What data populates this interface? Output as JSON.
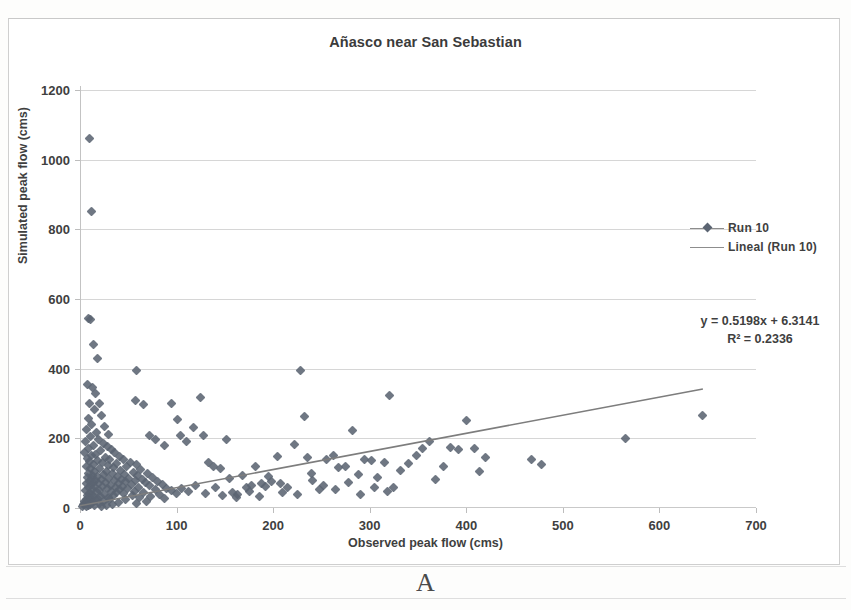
{
  "figure": {
    "panel_label": "A"
  },
  "chart_data": {
    "type": "scatter",
    "title": "Añasco near San Sebastian",
    "xlabel": "Observed peak flow (cms)",
    "ylabel": "Simulated peak flow (cms)",
    "xlim": [
      0,
      700
    ],
    "ylim": [
      0,
      1200
    ],
    "xticks": [
      0,
      100,
      200,
      300,
      400,
      500,
      600,
      700
    ],
    "yticks": [
      0,
      200,
      400,
      600,
      800,
      1000,
      1200
    ],
    "grid": "horizontal",
    "legend_position": "right",
    "marker_color": "#5b6472",
    "trendline_color": "#7d7d7d",
    "gridline_color": "#d6d6d6",
    "series": [
      {
        "name": "Run 10",
        "kind": "scatter",
        "marker": "diamond",
        "points": [
          [
            10,
            1060
          ],
          [
            12,
            850
          ],
          [
            9,
            545
          ],
          [
            11,
            540
          ],
          [
            14,
            470
          ],
          [
            18,
            430
          ],
          [
            8,
            355
          ],
          [
            13,
            345
          ],
          [
            16,
            330
          ],
          [
            10,
            300
          ],
          [
            20,
            300
          ],
          [
            15,
            282
          ],
          [
            22,
            265
          ],
          [
            9,
            258
          ],
          [
            12,
            240
          ],
          [
            25,
            235
          ],
          [
            7,
            225
          ],
          [
            17,
            218
          ],
          [
            30,
            212
          ],
          [
            11,
            205
          ],
          [
            19,
            198
          ],
          [
            6,
            192
          ],
          [
            24,
            185
          ],
          [
            14,
            180
          ],
          [
            28,
            176
          ],
          [
            9,
            172
          ],
          [
            33,
            168
          ],
          [
            21,
            164
          ],
          [
            5,
            160
          ],
          [
            36,
            158
          ],
          [
            16,
            154
          ],
          [
            12,
            150
          ],
          [
            41,
            148
          ],
          [
            26,
            145
          ],
          [
            8,
            142
          ],
          [
            45,
            140
          ],
          [
            31,
            138
          ],
          [
            18,
            136
          ],
          [
            10,
            134
          ],
          [
            52,
            132
          ],
          [
            23,
            130
          ],
          [
            38,
            128
          ],
          [
            14,
            126
          ],
          [
            58,
            124
          ],
          [
            29,
            122
          ],
          [
            7,
            120
          ],
          [
            48,
            118
          ],
          [
            35,
            116
          ],
          [
            20,
            114
          ],
          [
            11,
            112
          ],
          [
            63,
            110
          ],
          [
            42,
            108
          ],
          [
            27,
            106
          ],
          [
            15,
            104
          ],
          [
            55,
            102
          ],
          [
            34,
            100
          ],
          [
            9,
            99
          ],
          [
            70,
            98
          ],
          [
            46,
            96
          ],
          [
            24,
            95
          ],
          [
            13,
            94
          ],
          [
            60,
            92
          ],
          [
            39,
            90
          ],
          [
            18,
            89
          ],
          [
            8,
            88
          ],
          [
            75,
            87
          ],
          [
            50,
            86
          ],
          [
            30,
            85
          ],
          [
            12,
            84
          ],
          [
            65,
            83
          ],
          [
            43,
            82
          ],
          [
            22,
            81
          ],
          [
            16,
            80
          ],
          [
            57,
            79
          ],
          [
            36,
            78
          ],
          [
            10,
            77
          ],
          [
            80,
            76
          ],
          [
            47,
            75
          ],
          [
            26,
            74
          ],
          [
            14,
            73
          ],
          [
            68,
            72
          ],
          [
            40,
            71
          ],
          [
            19,
            70
          ],
          [
            7,
            69
          ],
          [
            85,
            68
          ],
          [
            53,
            67
          ],
          [
            32,
            66
          ],
          [
            11,
            65
          ],
          [
            72,
            64
          ],
          [
            44,
            63
          ],
          [
            23,
            62
          ],
          [
            15,
            61
          ],
          [
            61,
            60
          ],
          [
            37,
            59
          ],
          [
            9,
            58
          ],
          [
            90,
            57
          ],
          [
            49,
            56
          ],
          [
            28,
            55
          ],
          [
            13,
            54
          ],
          [
            78,
            53
          ],
          [
            41,
            52
          ],
          [
            20,
            51
          ],
          [
            6,
            50
          ],
          [
            95,
            49
          ],
          [
            56,
            48
          ],
          [
            33,
            47
          ],
          [
            17,
            46
          ],
          [
            66,
            45
          ],
          [
            38,
            44
          ],
          [
            10,
            43
          ],
          [
            100,
            42
          ],
          [
            45,
            41
          ],
          [
            25,
            40
          ],
          [
            12,
            39
          ],
          [
            82,
            38
          ],
          [
            35,
            37
          ],
          [
            8,
            36
          ],
          [
            54,
            35
          ],
          [
            21,
            34
          ],
          [
            14,
            33
          ],
          [
            73,
            32
          ],
          [
            29,
            31
          ],
          [
            9,
            30
          ],
          [
            62,
            29
          ],
          [
            18,
            28
          ],
          [
            11,
            27
          ],
          [
            88,
            26
          ],
          [
            31,
            25
          ],
          [
            7,
            24
          ],
          [
            47,
            23
          ],
          [
            16,
            22
          ],
          [
            10,
            21
          ],
          [
            69,
            20
          ],
          [
            24,
            19
          ],
          [
            5,
            18
          ],
          [
            40,
            17
          ],
          [
            13,
            16
          ],
          [
            8,
            15
          ],
          [
            58,
            14
          ],
          [
            20,
            13
          ],
          [
            6,
            12
          ],
          [
            34,
            11
          ],
          [
            11,
            10
          ],
          [
            4,
            9
          ],
          [
            27,
            8
          ],
          [
            9,
            7
          ],
          [
            15,
            6
          ],
          [
            3,
            5
          ],
          [
            22,
            4
          ],
          [
            7,
            3
          ],
          [
            58,
            395
          ],
          [
            57,
            310
          ],
          [
            66,
            298
          ],
          [
            72,
            208
          ],
          [
            78,
            196
          ],
          [
            88,
            178
          ],
          [
            95,
            300
          ],
          [
            101,
            255
          ],
          [
            104,
            208
          ],
          [
            110,
            190
          ],
          [
            118,
            230
          ],
          [
            125,
            318
          ],
          [
            128,
            208
          ],
          [
            133,
            130
          ],
          [
            138,
            120
          ],
          [
            145,
            112
          ],
          [
            152,
            198
          ],
          [
            158,
            45
          ],
          [
            163,
            38
          ],
          [
            168,
            92
          ],
          [
            172,
            60
          ],
          [
            178,
            65
          ],
          [
            182,
            118
          ],
          [
            188,
            70
          ],
          [
            192,
            62
          ],
          [
            198,
            75
          ],
          [
            204,
            148
          ],
          [
            208,
            70
          ],
          [
            215,
            58
          ],
          [
            222,
            182
          ],
          [
            228,
            395
          ],
          [
            232,
            262
          ],
          [
            236,
            145
          ],
          [
            241,
            80
          ],
          [
            248,
            52
          ],
          [
            255,
            138
          ],
          [
            262,
            150
          ],
          [
            268,
            115
          ],
          [
            275,
            120
          ],
          [
            282,
            222
          ],
          [
            288,
            96
          ],
          [
            295,
            140
          ],
          [
            302,
            135
          ],
          [
            308,
            88
          ],
          [
            315,
            132
          ],
          [
            320,
            322
          ],
          [
            325,
            60
          ],
          [
            332,
            108
          ],
          [
            340,
            128
          ],
          [
            348,
            150
          ],
          [
            355,
            172
          ],
          [
            362,
            190
          ],
          [
            368,
            82
          ],
          [
            376,
            118
          ],
          [
            384,
            175
          ],
          [
            392,
            168
          ],
          [
            400,
            250
          ],
          [
            408,
            172
          ],
          [
            414,
            105
          ],
          [
            420,
            145
          ],
          [
            468,
            140
          ],
          [
            478,
            126
          ],
          [
            565,
            200
          ],
          [
            645,
            265
          ],
          [
            105,
            55
          ],
          [
            112,
            48
          ],
          [
            120,
            66
          ],
          [
            130,
            42
          ],
          [
            140,
            58
          ],
          [
            148,
            36
          ],
          [
            155,
            84
          ],
          [
            162,
            30
          ],
          [
            175,
            46
          ],
          [
            186,
            34
          ],
          [
            195,
            90
          ],
          [
            210,
            44
          ],
          [
            225,
            38
          ],
          [
            240,
            100
          ],
          [
            252,
            66
          ],
          [
            265,
            54
          ],
          [
            278,
            72
          ],
          [
            290,
            40
          ],
          [
            305,
            58
          ],
          [
            318,
            46
          ]
        ]
      },
      {
        "name": "Lineal (Run 10)",
        "kind": "trendline",
        "equation": "y = 0.5198x + 6.3141",
        "r_squared_label": "R² = 0.2336",
        "slope": 0.5198,
        "intercept": 6.3141,
        "r_squared": 0.2336,
        "x_start": 0,
        "x_end": 645
      }
    ],
    "annotations": [
      {
        "name": "regression-equation",
        "text": "y = 0.5198x + 6.3141"
      },
      {
        "name": "r-squared",
        "text": "R² = 0.2336"
      }
    ]
  }
}
